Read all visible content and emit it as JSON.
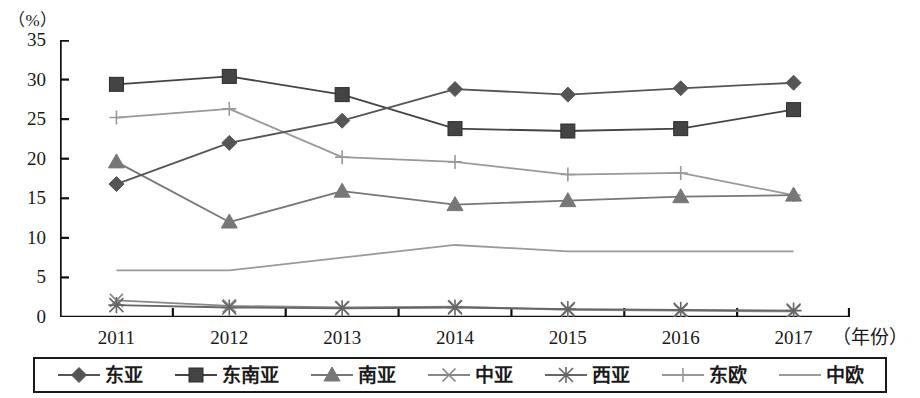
{
  "chart_data": {
    "type": "line",
    "title": "",
    "subtitle": "",
    "xlabel": "（年份）",
    "ylabel": "（%）",
    "categories": [
      "2011",
      "2012",
      "2013",
      "2014",
      "2015",
      "2016",
      "2017"
    ],
    "x": [
      2011,
      2012,
      2013,
      2014,
      2015,
      2016,
      2017
    ],
    "ylim": [
      0,
      35
    ],
    "yticks": [
      0,
      5,
      10,
      15,
      20,
      25,
      30,
      35
    ],
    "grid": false,
    "legend_position": "bottom",
    "series": [
      {
        "name": "东亚",
        "marker": "diamond",
        "color": "#555555",
        "values": [
          16.8,
          22.0,
          24.8,
          28.8,
          28.1,
          28.9,
          29.6
        ]
      },
      {
        "name": "东南亚",
        "marker": "square",
        "color": "#444444",
        "values": [
          29.4,
          30.4,
          28.1,
          23.8,
          23.5,
          23.8,
          26.2
        ]
      },
      {
        "name": "南亚",
        "marker": "triangle",
        "color": "#777777",
        "values": [
          19.6,
          12.0,
          15.9,
          14.2,
          14.7,
          15.2,
          15.4
        ]
      },
      {
        "name": "中亚",
        "marker": "cross",
        "color": "#888888",
        "values": [
          2.1,
          1.4,
          1.2,
          1.3,
          0.9,
          0.8,
          0.7
        ]
      },
      {
        "name": "西亚",
        "marker": "asterisk",
        "color": "#666666",
        "values": [
          1.5,
          1.2,
          1.1,
          1.2,
          1.0,
          0.9,
          0.8
        ]
      },
      {
        "name": "东欧",
        "marker": "plus",
        "color": "#999999",
        "values": [
          25.2,
          26.3,
          20.2,
          19.6,
          18.0,
          18.2,
          15.4
        ]
      },
      {
        "name": "中欧",
        "marker": "none",
        "color": "#9a9a9a",
        "values": [
          5.9,
          5.9,
          7.5,
          9.1,
          8.3,
          8.3,
          8.3
        ]
      }
    ]
  },
  "axis": {
    "unit_label": "（%）",
    "x_unit_label": "（年份）"
  },
  "legend": {
    "items": [
      {
        "label": "东亚",
        "marker": "diamond-marker"
      },
      {
        "label": "东南亚",
        "marker": "square-marker"
      },
      {
        "label": "南亚",
        "marker": "triangle-marker"
      },
      {
        "label": "中亚",
        "marker": "cross-marker"
      },
      {
        "label": "西亚",
        "marker": "asterisk-marker"
      },
      {
        "label": "东欧",
        "marker": "plus-marker"
      },
      {
        "label": "中欧",
        "marker": "line-marker"
      }
    ]
  }
}
